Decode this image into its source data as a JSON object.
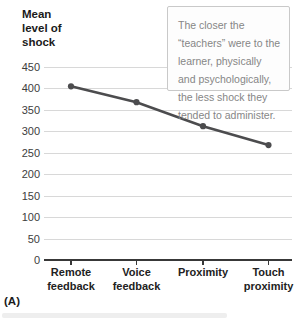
{
  "figure_label": "(A)",
  "y_axis_title": "Mean\nlevel of\nshock",
  "annotation": {
    "text": "The closer the\n“teachers” were to the\nlearner, physically\nand psychologically,\nthe less shock they\ntended to administer."
  },
  "chart_data": {
    "type": "line",
    "categories": [
      "Remote feedback",
      "Voice feedback",
      "Proximity",
      "Touch proximity"
    ],
    "values": [
      405,
      368,
      312,
      268
    ],
    "title": "",
    "xlabel": "",
    "ylabel": "Mean level of shock",
    "ylim": [
      0,
      450
    ],
    "yticks": [
      0,
      50,
      100,
      150,
      200,
      250,
      300,
      350,
      400,
      450
    ],
    "grid": true,
    "legend": false,
    "annotation": "The closer the “teachers” were to the learner, physically and psychologically, the less shock they tended to administer.",
    "line_color": "#4c4c4e",
    "marker_color": "#4c4c4e",
    "grid_color": "#d8d8d8",
    "axis_color": "#383838"
  }
}
